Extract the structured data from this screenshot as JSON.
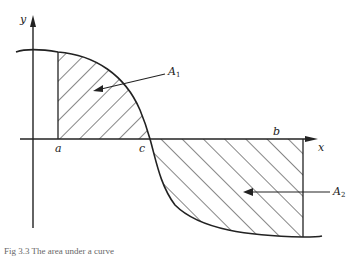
{
  "figure": {
    "axes": {
      "x_label": "x",
      "y_label": "y"
    },
    "points": {
      "a": "a",
      "b": "b",
      "c": "c"
    },
    "areas": [
      {
        "name": "A",
        "sub": "1"
      },
      {
        "name": "A",
        "sub": "2"
      }
    ],
    "caption": "Fig 3.3 The area under a curve"
  }
}
